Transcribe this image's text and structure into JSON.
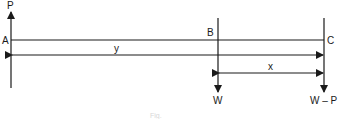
{
  "diagram": {
    "type": "beam-force-diagram",
    "points": [
      {
        "id": "A",
        "label": "A"
      },
      {
        "id": "B",
        "label": "B"
      },
      {
        "id": "C",
        "label": "C"
      }
    ],
    "forces": [
      {
        "at": "A",
        "label": "P",
        "direction": "up"
      },
      {
        "at": "B",
        "label": "W",
        "direction": "down"
      },
      {
        "at": "C",
        "label": "W – P",
        "direction": "down"
      }
    ],
    "dimensions": [
      {
        "from": "A",
        "to": "C",
        "label": "y"
      },
      {
        "from": "B",
        "to": "C",
        "label": "x"
      }
    ],
    "caption": "Fig."
  },
  "colors": {
    "line": "#1a1a1a",
    "background": "#ffffff"
  }
}
